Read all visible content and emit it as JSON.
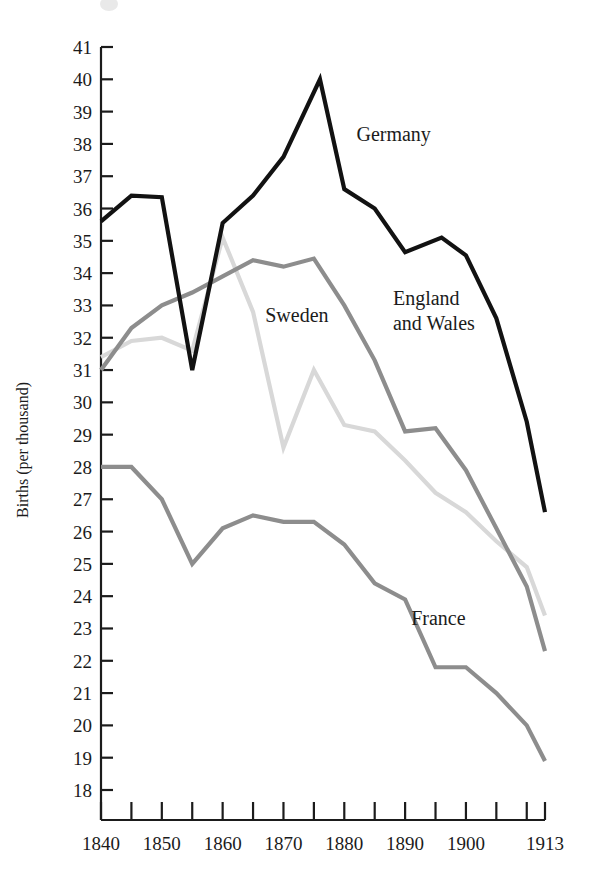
{
  "chart_data": {
    "type": "line",
    "title": "",
    "xlabel": "",
    "ylabel": "Births (per thousand)",
    "xlim": [
      1840,
      1913
    ],
    "ylim": [
      18,
      41
    ],
    "grid": false,
    "legend_position": "inline-annotations",
    "x_ticks": [
      1840,
      1845,
      1850,
      1855,
      1860,
      1865,
      1870,
      1875,
      1880,
      1885,
      1890,
      1895,
      1900,
      1905,
      1910,
      1913
    ],
    "x_tick_labels": [
      "1840",
      "",
      "1850",
      "",
      "1860",
      "",
      "1870",
      "",
      "1880",
      "",
      "1890",
      "",
      "1900",
      "",
      "",
      "1913"
    ],
    "y_ticks": [
      18,
      19,
      20,
      21,
      22,
      23,
      24,
      25,
      26,
      27,
      28,
      29,
      30,
      31,
      32,
      33,
      34,
      35,
      36,
      37,
      38,
      39,
      40,
      41
    ],
    "y_tick_labels": [
      "18",
      "19",
      "20",
      "21",
      "22",
      "23",
      "24",
      "25",
      "26",
      "27",
      "28",
      "29",
      "30",
      "31",
      "32",
      "33",
      "34",
      "35",
      "36",
      "37",
      "38",
      "39",
      "40",
      "41"
    ],
    "series": [
      {
        "name": "Germany",
        "color": "#121212",
        "width": 4.2,
        "label_x": 1882,
        "label_y": 38.1,
        "x": [
          1840,
          1845,
          1850,
          1855,
          1860,
          1865,
          1870,
          1876,
          1880,
          1885,
          1890,
          1896,
          1900,
          1905,
          1910,
          1913
        ],
        "y": [
          35.6,
          36.4,
          36.35,
          31.0,
          35.55,
          36.4,
          37.6,
          40.0,
          36.6,
          36.0,
          34.65,
          35.1,
          34.55,
          32.6,
          29.4,
          26.6
        ]
      },
      {
        "name": "England and Wales",
        "color": "#8d8d8d",
        "width": 4.2,
        "label_x": 1888,
        "label_y": 33.0,
        "x": [
          1840,
          1845,
          1850,
          1855,
          1860,
          1865,
          1870,
          1875,
          1880,
          1885,
          1890,
          1895,
          1900,
          1905,
          1910,
          1913
        ],
        "y": [
          31.0,
          32.3,
          33.0,
          33.4,
          33.9,
          34.4,
          34.2,
          34.45,
          33.0,
          31.3,
          29.1,
          29.2,
          27.9,
          26.1,
          24.3,
          22.3
        ]
      },
      {
        "name": "Sweden",
        "color": "#d8d8d8",
        "width": 4.2,
        "label_x": 1867,
        "label_y": 32.5,
        "x": [
          1840,
          1845,
          1850,
          1855,
          1860,
          1865,
          1870,
          1875,
          1880,
          1885,
          1890,
          1895,
          1900,
          1905,
          1910,
          1913
        ],
        "y": [
          31.4,
          31.9,
          32.0,
          31.6,
          35.1,
          32.8,
          28.6,
          31.0,
          29.3,
          29.1,
          28.2,
          27.2,
          26.6,
          25.7,
          24.9,
          23.4
        ]
      },
      {
        "name": "France",
        "color": "#8d8d8d",
        "width": 4.2,
        "label_x": 1891,
        "label_y": 23.1,
        "x": [
          1840,
          1845,
          1850,
          1855,
          1860,
          1865,
          1870,
          1875,
          1880,
          1885,
          1890,
          1895,
          1900,
          1905,
          1910,
          1913
        ],
        "y": [
          28.0,
          28.0,
          27.0,
          25.0,
          26.1,
          26.5,
          26.3,
          26.3,
          25.6,
          24.4,
          23.9,
          21.8,
          21.8,
          21.0,
          20.0,
          18.9
        ]
      }
    ]
  },
  "axis": {
    "y_label": "Births (per thousand)"
  }
}
